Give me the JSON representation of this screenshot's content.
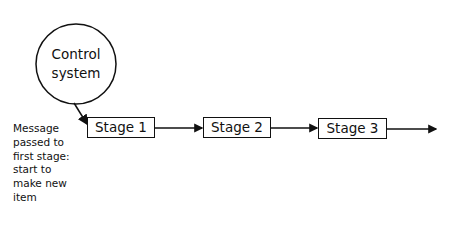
{
  "diagram": {
    "control": {
      "label_line1": "Control",
      "label_line2": "system"
    },
    "stages": [
      {
        "label": "Stage 1"
      },
      {
        "label": "Stage 2"
      },
      {
        "label": "Stage 3"
      }
    ],
    "note": {
      "lines": [
        "Message",
        "passed to",
        "first stage:",
        "start to",
        "make new",
        "item"
      ]
    }
  }
}
